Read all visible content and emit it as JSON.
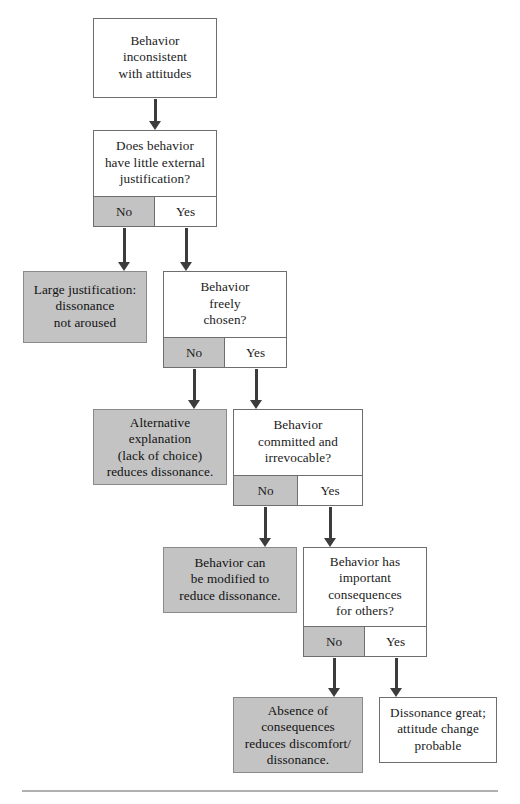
{
  "diagram": {
    "colors": {
      "gray_fill": "#c3c3c3",
      "white_fill": "#ffffff",
      "border": "#6e6e6e",
      "arrow": "#3c3c3c",
      "rule": "#b0b0b0"
    },
    "answer_labels": {
      "no": "No",
      "yes": "Yes"
    },
    "nodes": [
      {
        "id": "start",
        "kind": "statement",
        "fill": "white",
        "text": "Behavior\ninconsistent\nwith attitudes"
      },
      {
        "id": "d1",
        "kind": "decision",
        "fill": "white",
        "text": "Does behavior\nhave little external\njustification?",
        "no": "No",
        "yes": "Yes"
      },
      {
        "id": "o1",
        "kind": "outcome",
        "fill": "gray",
        "text": "Large justification:\ndissonance\nnot aroused"
      },
      {
        "id": "d2",
        "kind": "decision",
        "fill": "white",
        "text": "Behavior\nfreely\nchosen?",
        "no": "No",
        "yes": "Yes"
      },
      {
        "id": "o2",
        "kind": "outcome",
        "fill": "gray",
        "text": "Alternative\nexplanation\n(lack of choice)\nreduces dissonance."
      },
      {
        "id": "d3",
        "kind": "decision",
        "fill": "white",
        "text": "Behavior\ncommitted and\nirrevocable?",
        "no": "No",
        "yes": "Yes"
      },
      {
        "id": "o3",
        "kind": "outcome",
        "fill": "gray",
        "text": "Behavior can\nbe modified to\nreduce dissonance."
      },
      {
        "id": "d4",
        "kind": "decision",
        "fill": "white",
        "text": "Behavior has\nimportant\nconsequences\nfor others?",
        "no": "No",
        "yes": "Yes"
      },
      {
        "id": "o4",
        "kind": "outcome",
        "fill": "gray",
        "text": "Absence of\nconsequences\nreduces discomfort/\ndissonance."
      },
      {
        "id": "o5",
        "kind": "outcome",
        "fill": "white",
        "text": "Dissonance great;\nattitude change\nprobable"
      }
    ]
  }
}
